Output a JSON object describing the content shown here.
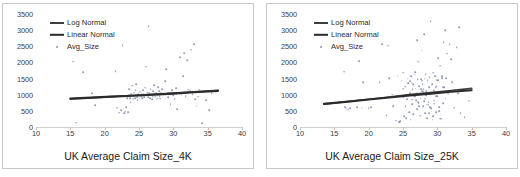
{
  "figure": {
    "background": "#ffffff",
    "panel_border": "#c9c9c9"
  },
  "colors": {
    "log_normal_line": "#3f3f3f",
    "linear_normal_line": "#2b2b2b",
    "point": "#8e96b4",
    "axis": "#d0d0d0",
    "text": "#2b2b2b"
  },
  "chart_data": [
    {
      "type": "scatter",
      "id": "left",
      "title": "",
      "xlabel": "UK Average Claim Size_4K",
      "ylabel": "",
      "xlim": [
        10,
        40
      ],
      "ylim": [
        0,
        3500
      ],
      "xticks": [
        10,
        15,
        20,
        25,
        30,
        35,
        40
      ],
      "yticks": [
        0,
        500,
        1000,
        1500,
        2000,
        2500,
        3000,
        3500
      ],
      "grid": false,
      "legend_position": "top-left",
      "legend": [
        "Log Normal",
        "Linear Normal",
        "Avg_Size"
      ],
      "series": [
        {
          "name": "Log Normal",
          "type": "line",
          "x": [
            15.0,
            18.0,
            21.0,
            24.0,
            27.0,
            30.0,
            33.0,
            36.5
          ],
          "values": [
            870,
            905,
            940,
            975,
            1010,
            1050,
            1090,
            1135
          ]
        },
        {
          "name": "Linear Normal",
          "type": "line",
          "x": [
            15.0,
            18.0,
            21.0,
            24.0,
            27.0,
            30.0,
            33.0,
            36.5
          ],
          "values": [
            880,
            910,
            940,
            970,
            1000,
            1035,
            1075,
            1120
          ]
        },
        {
          "name": "Avg_Size",
          "type": "scatter",
          "x": [
            15.4,
            15.8,
            16.9,
            17.2,
            18.2,
            18.6,
            19.6,
            21.6,
            21.8,
            22.1,
            22.4,
            22.6,
            22.8,
            23.0,
            23.1,
            23.3,
            23.4,
            23.5,
            23.6,
            23.7,
            23.8,
            23.9,
            24.0,
            24.1,
            24.2,
            24.3,
            24.4,
            24.5,
            24.6,
            24.7,
            24.8,
            24.9,
            25.0,
            25.1,
            25.2,
            25.3,
            25.4,
            25.5,
            25.6,
            25.7,
            25.8,
            25.9,
            26.0,
            26.1,
            26.2,
            26.3,
            26.4,
            26.5,
            26.6,
            26.7,
            26.8,
            26.9,
            27.0,
            27.1,
            27.2,
            27.3,
            27.4,
            27.5,
            27.6,
            27.7,
            27.8,
            27.9,
            28.0,
            28.1,
            28.2,
            28.4,
            28.6,
            28.8,
            29.0,
            29.2,
            29.4,
            29.6,
            29.8,
            30.0,
            30.2,
            30.4,
            30.6,
            30.8,
            31.0,
            31.2,
            31.4,
            31.6,
            31.8,
            32.0,
            32.2,
            32.4,
            32.6,
            32.8,
            33.0,
            33.2,
            33.4,
            33.6,
            33.8,
            34.2,
            34.8,
            35.2,
            35.6,
            36.0
          ],
          "values": [
            2020,
            130,
            1700,
            880,
            1050,
            670,
            930,
            1720,
            600,
            440,
            520,
            2530,
            420,
            480,
            620,
            900,
            470,
            980,
            1180,
            900,
            760,
            1010,
            1280,
            880,
            960,
            1060,
            900,
            1150,
            1330,
            930,
            840,
            1010,
            990,
            880,
            1090,
            960,
            1020,
            890,
            1140,
            1010,
            930,
            1220,
            1870,
            980,
            1060,
            920,
            3120,
            1040,
            900,
            1180,
            1000,
            860,
            960,
            1120,
            1300,
            1020,
            940,
            1060,
            880,
            990,
            1230,
            1100,
            960,
            880,
            1040,
            1180,
            1000,
            1420,
            1790,
            920,
            1050,
            700,
            1140,
            990,
            870,
            1210,
            550,
            1060,
            2160,
            1000,
            1580,
            2290,
            950,
            2080,
            1160,
            1130,
            2400,
            1020,
            2570,
            870,
            660,
            940,
            1160,
            120,
            830,
            530,
            1050
          ]
        }
      ]
    },
    {
      "type": "scatter",
      "id": "right",
      "title": "",
      "xlabel": "UK Average Claim Size_25K",
      "ylabel": "",
      "xlim": [
        10,
        40
      ],
      "ylim": [
        0,
        3500
      ],
      "xticks": [
        10,
        15,
        20,
        25,
        30,
        35,
        40
      ],
      "yticks": [
        0,
        500,
        1000,
        1500,
        2000,
        2500,
        3000,
        3500
      ],
      "grid": false,
      "legend_position": "top-left",
      "legend": [
        "Log Normal",
        "Linear Normal",
        "Avg_Size"
      ],
      "series": [
        {
          "name": "Log Normal",
          "type": "line",
          "x": [
            13.5,
            17.0,
            20.0,
            23.0,
            26.0,
            29.0,
            32.0,
            35.0
          ],
          "values": [
            710,
            790,
            860,
            930,
            1000,
            1065,
            1130,
            1195
          ]
        },
        {
          "name": "Linear Normal",
          "type": "line",
          "x": [
            13.5,
            17.0,
            20.0,
            23.0,
            26.0,
            29.0,
            32.0,
            35.0
          ],
          "values": [
            715,
            785,
            850,
            915,
            980,
            1035,
            1090,
            1140
          ]
        },
        {
          "name": "Avg_Size",
          "type": "scatter",
          "x": [
            16.4,
            16.6,
            16.8,
            17.0,
            17.3,
            18.3,
            18.6,
            19.0,
            19.2,
            20.0,
            20.4,
            21.6,
            22.0,
            22.6,
            22.8,
            23.0,
            23.4,
            23.6,
            24.0,
            24.2,
            24.4,
            24.6,
            24.8,
            25.0,
            25.1,
            25.2,
            25.3,
            25.4,
            25.5,
            25.6,
            25.7,
            25.8,
            25.9,
            26.0,
            26.1,
            26.2,
            26.3,
            26.4,
            26.5,
            26.6,
            26.7,
            26.8,
            26.9,
            27.0,
            27.05,
            27.1,
            27.15,
            27.2,
            27.3,
            27.4,
            27.5,
            27.6,
            27.7,
            27.8,
            27.9,
            28.0,
            28.05,
            28.1,
            28.15,
            28.2,
            28.3,
            28.4,
            28.5,
            28.6,
            28.7,
            28.8,
            28.9,
            29.0,
            29.05,
            29.1,
            29.2,
            29.3,
            29.4,
            29.5,
            29.6,
            29.7,
            29.8,
            29.9,
            30.0,
            30.1,
            30.2,
            30.3,
            30.4,
            30.5,
            30.6,
            30.7,
            30.8,
            30.9,
            31.0,
            31.1,
            31.2,
            31.3,
            31.4,
            31.6,
            31.8,
            32.0,
            32.2,
            32.4,
            32.6,
            32.8,
            33.0,
            33.2,
            33.4,
            34.0,
            34.6,
            25.05,
            26.05,
            27.25,
            28.25,
            29.25,
            30.25,
            26.45,
            27.45,
            28.45,
            29.45,
            30.45,
            26.75,
            27.75,
            28.75,
            29.75,
            30.75,
            27.35,
            28.35,
            29.35,
            26.25,
            27.55,
            28.55,
            29.55,
            26.85,
            27.85,
            28.85,
            29.85,
            30.85,
            27.95,
            28.95,
            29.95,
            26.35,
            27.65,
            28.65,
            29.65,
            30.65
          ],
          "values": [
            1710,
            620,
            570,
            540,
            590,
            620,
            2050,
            600,
            1390,
            590,
            610,
            1390,
            2560,
            370,
            2520,
            1520,
            1000,
            640,
            200,
            1590,
            150,
            180,
            1440,
            1680,
            920,
            330,
            1250,
            640,
            280,
            870,
            1500,
            1350,
            460,
            1050,
            230,
            1580,
            700,
            1180,
            400,
            940,
            1620,
            1700,
            830,
            1060,
            2700,
            560,
            1490,
            2020,
            730,
            1260,
            350,
            1490,
            2360,
            1100,
            640,
            1180,
            2880,
            790,
            1500,
            420,
            1640,
            980,
            280,
            1460,
            690,
            1240,
            1550,
            1020,
            3280,
            580,
            1320,
            230,
            1680,
            820,
            1120,
            1580,
            470,
            1260,
            950,
            2140,
            1460,
            620,
            1900,
            1070,
            260,
            1580,
            740,
            2620,
            1230,
            3000,
            880,
            1510,
            2270,
            1030,
            2560,
            2110,
            1390,
            600,
            1160,
            2470,
            1040,
            3090,
            430,
            310,
            820,
            1190,
            1410,
            760,
            880,
            1040,
            500,
            1320,
            1010,
            690,
            1150,
            260,
            960,
            1440,
            780,
            1230,
            1510,
            640,
            1110,
            330,
            1370,
            880,
            1060,
            720,
            1190,
            1330,
            430,
            960,
            1240,
            1090,
            620,
            1450,
            850,
            1170
          ]
        }
      ]
    }
  ]
}
